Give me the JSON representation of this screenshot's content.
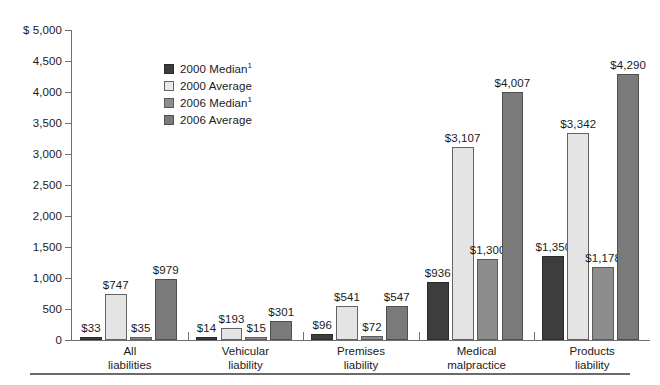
{
  "chart_data": {
    "type": "bar",
    "title": "",
    "xlabel": "",
    "ylabel": "",
    "ylim": [
      0,
      5000
    ],
    "grid": false,
    "axis_prefix": "$",
    "legend_position": "inside-upper-left",
    "y_ticks": [
      {
        "value": 5000,
        "label": "$ 5,000"
      },
      {
        "value": 4500,
        "label": "4,500"
      },
      {
        "value": 4000,
        "label": "4,000"
      },
      {
        "value": 3500,
        "label": "3,500"
      },
      {
        "value": 3000,
        "label": "3,000"
      },
      {
        "value": 2500,
        "label": "2,500"
      },
      {
        "value": 2000,
        "label": "2,000"
      },
      {
        "value": 1500,
        "label": "1,500"
      },
      {
        "value": 1000,
        "label": "1,000"
      },
      {
        "value": 500,
        "label": "500"
      },
      {
        "value": 0,
        "label": "0"
      }
    ],
    "categories": [
      "All liabilities",
      "Vehicular liability",
      "Premises liability",
      "Medical malpractice",
      "Products liability"
    ],
    "category_lines": [
      [
        "All",
        "liabilities"
      ],
      [
        "Vehicular",
        "liability"
      ],
      [
        "Premises",
        "liability"
      ],
      [
        "Medical",
        "malpractice"
      ],
      [
        "Products",
        "liability"
      ]
    ],
    "series": [
      {
        "name": "2000 Median",
        "legend_label": "2000 Median",
        "legend_footnote": "1",
        "color": "#3d3d3d",
        "values": [
          33,
          14,
          96,
          936,
          1350
        ],
        "labels": [
          "$33",
          "$14",
          "$96",
          "$936",
          "$1,350"
        ]
      },
      {
        "name": "2000 Average",
        "legend_label": "2000 Average",
        "legend_footnote": "",
        "color": "#e4e4e4",
        "values": [
          747,
          193,
          541,
          3107,
          3342
        ],
        "labels": [
          "$747",
          "$193",
          "$541",
          "$3,107",
          "$3,342"
        ]
      },
      {
        "name": "2006 Median",
        "legend_label": "2006 Median",
        "legend_footnote": "1",
        "color": "#8d8d8d",
        "values": [
          35,
          15,
          72,
          1300,
          1178
        ],
        "labels": [
          "$35",
          "$15",
          "$72",
          "$1,300",
          "$1,178"
        ]
      },
      {
        "name": "2006 Average",
        "legend_label": "2006 Average",
        "legend_footnote": "",
        "color": "#7a7a7a",
        "values": [
          979,
          301,
          547,
          4007,
          4290
        ],
        "labels": [
          "$979",
          "$301",
          "$547",
          "$4,007",
          "$4,290"
        ]
      }
    ]
  }
}
